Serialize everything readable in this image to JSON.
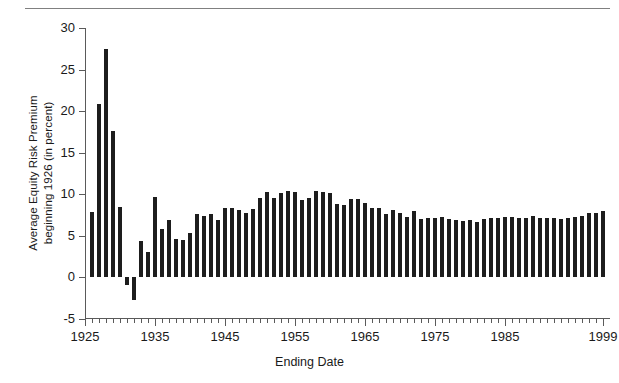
{
  "figure": {
    "has_top_rule": true,
    "background": "#ffffff",
    "bar_color": "#1d1d1d",
    "axis_color": "#5a5a5a",
    "text_color": "#1a1a1a"
  },
  "chart_data": {
    "type": "bar",
    "title": "",
    "xlabel": "Ending Date",
    "ylabel": "Average Equity Risk Premium\nbeginning 1926 (in percent)",
    "ylim": [
      -5,
      30
    ],
    "xlim": [
      1925,
      2000
    ],
    "grid": false,
    "legend": null,
    "ytick_labels": [
      "30",
      "25",
      "20",
      "15",
      "10",
      "5",
      "0",
      "-5"
    ],
    "ytick_values": [
      30,
      25,
      20,
      15,
      10,
      5,
      0,
      -5
    ],
    "xtick_labels": [
      "1925",
      "1935",
      "1945",
      "1955",
      "1965",
      "1975",
      "1985",
      "1999"
    ],
    "xtick_values": [
      1925,
      1935,
      1945,
      1955,
      1965,
      1975,
      1985,
      1999
    ],
    "xtick_minor_step": 1,
    "categories": [
      1926,
      1927,
      1928,
      1929,
      1930,
      1931,
      1932,
      1933,
      1934,
      1935,
      1936,
      1937,
      1938,
      1939,
      1940,
      1941,
      1942,
      1943,
      1944,
      1945,
      1946,
      1947,
      1948,
      1949,
      1950,
      1951,
      1952,
      1953,
      1954,
      1955,
      1956,
      1957,
      1958,
      1959,
      1960,
      1961,
      1962,
      1963,
      1964,
      1965,
      1966,
      1967,
      1968,
      1969,
      1970,
      1971,
      1972,
      1973,
      1974,
      1975,
      1976,
      1977,
      1978,
      1979,
      1980,
      1981,
      1982,
      1983,
      1984,
      1985,
      1986,
      1987,
      1988,
      1989,
      1990,
      1991,
      1992,
      1993,
      1994,
      1995,
      1996,
      1997,
      1998,
      1999
    ],
    "values": [
      7.9,
      20.9,
      27.5,
      17.6,
      8.5,
      -0.9,
      -2.7,
      4.4,
      3.1,
      9.7,
      5.8,
      6.9,
      4.6,
      4.5,
      5.4,
      7.6,
      7.4,
      7.6,
      6.9,
      8.3,
      8.3,
      8.1,
      7.7,
      8.2,
      9.5,
      10.3,
      9.5,
      10.1,
      10.4,
      10.3,
      9.3,
      9.5,
      10.4,
      10.3,
      10.1,
      8.8,
      8.7,
      9.4,
      9.4,
      9.0,
      8.4,
      8.4,
      7.6,
      8.1,
      7.8,
      7.3,
      8.0,
      7.0,
      7.1,
      7.1,
      7.3,
      7.0,
      6.9,
      6.8,
      6.9,
      6.7,
      7.0,
      7.2,
      7.1,
      7.3,
      7.3,
      7.1,
      7.2,
      7.4,
      7.1,
      7.2,
      7.1,
      7.0,
      7.1,
      7.3,
      7.4,
      7.7,
      7.8,
      8.0
    ]
  }
}
